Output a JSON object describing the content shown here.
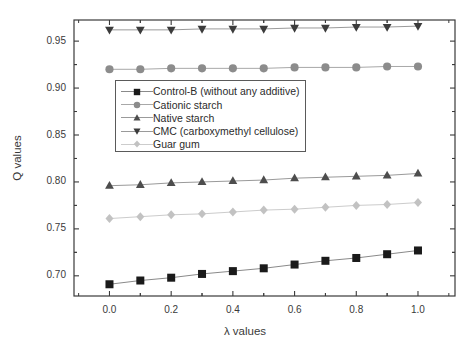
{
  "chart_data": {
    "type": "line",
    "title": "",
    "xlabel": "λ values",
    "ylabel": "Q values",
    "xlim": [
      -0.115,
      1.12
    ],
    "ylim": [
      0.6785,
      0.9725
    ],
    "xticks": [
      "0.0",
      "0.2",
      "0.4",
      "0.6",
      "0.8",
      "1.0"
    ],
    "xtick_values": [
      0.0,
      0.2,
      0.4,
      0.6,
      0.8,
      1.0
    ],
    "yticks": [
      "0.70",
      "0.75",
      "0.80",
      "0.85",
      "0.90",
      "0.95"
    ],
    "ytick_values": [
      0.7,
      0.75,
      0.8,
      0.85,
      0.9,
      0.95
    ],
    "minor_ticks": true,
    "grid": false,
    "legend_position": "upper center inside",
    "x": [
      0.0,
      0.1,
      0.2,
      0.3,
      0.4,
      0.5,
      0.6,
      0.7,
      0.8,
      0.9,
      1.0
    ],
    "series": [
      {
        "name": "Control-B (without any additive)",
        "marker": "square",
        "color": "#1a1a1a",
        "line_color": "#8a8a8a",
        "values": [
          0.691,
          0.695,
          0.698,
          0.702,
          0.705,
          0.708,
          0.712,
          0.716,
          0.719,
          0.723,
          0.727
        ]
      },
      {
        "name": "Cationic starch",
        "marker": "circle",
        "color": "#8c8c8c",
        "line_color": "#a8a8a8",
        "values": [
          0.92,
          0.92,
          0.921,
          0.921,
          0.921,
          0.921,
          0.922,
          0.922,
          0.922,
          0.923,
          0.923
        ]
      },
      {
        "name": "Native starch",
        "marker": "triangle-up",
        "color": "#4d4d4d",
        "line_color": "#9a9a9a",
        "values": [
          0.796,
          0.797,
          0.799,
          0.8,
          0.801,
          0.802,
          0.804,
          0.805,
          0.806,
          0.807,
          0.809
        ]
      },
      {
        "name": "CMC (carboxymethyl cellulose)",
        "marker": "triangle-down",
        "color": "#3b3b3b",
        "line_color": "#9a9a9a",
        "values": [
          0.962,
          0.962,
          0.962,
          0.963,
          0.963,
          0.963,
          0.964,
          0.964,
          0.965,
          0.965,
          0.966
        ]
      },
      {
        "name": "Guar gum",
        "marker": "diamond",
        "color": "#c2c2c2",
        "line_color": "#cccccc",
        "values": [
          0.761,
          0.763,
          0.765,
          0.766,
          0.768,
          0.77,
          0.771,
          0.773,
          0.775,
          0.776,
          0.778
        ]
      }
    ]
  },
  "legend": {
    "items": [
      "Control-B (without any additive)",
      "Cationic starch",
      "Native starch",
      "CMC (carboxymethyl cellulose)",
      "Guar gum"
    ]
  },
  "colors": {
    "frame": "#3a3a3a",
    "background": "#ffffff",
    "text": "#2b2b2b"
  }
}
